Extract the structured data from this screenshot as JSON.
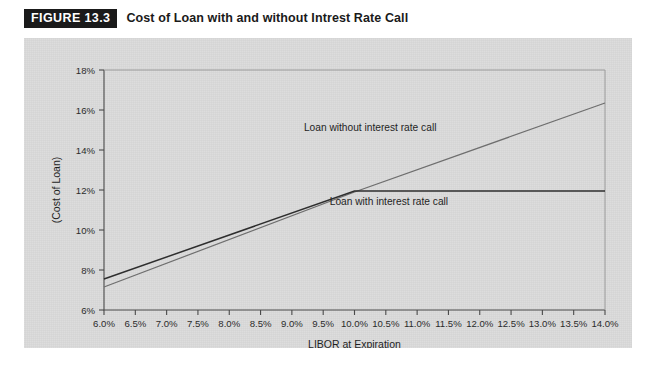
{
  "header": {
    "figure_tag": "FIGURE 13.3",
    "title": "Cost of Loan with and without Intrest Rate Call"
  },
  "chart_data": {
    "type": "line",
    "title": "Cost of Loan with and without Intrest Rate Call",
    "xlabel": "LIBOR at Expiration",
    "ylabel": "(Cost of Loan)",
    "grid": false,
    "legend_position": "inline-annotations",
    "xlim": [
      6.0,
      14.0
    ],
    "ylim": [
      6,
      18
    ],
    "y_ticks": [
      "6%",
      "8%",
      "10%",
      "12%",
      "14%",
      "16%",
      "18%"
    ],
    "y_tick_values": [
      6,
      8,
      10,
      12,
      14,
      16,
      18
    ],
    "x_ticks": [
      "6.0%",
      "6.5%",
      "7.0%",
      "7.5%",
      "8.0%",
      "8.5%",
      "9.0%",
      "9.5%",
      "10.0%",
      "10.5%",
      "11.0%",
      "11.5%",
      "12.0%",
      "12.5%",
      "13.0%",
      "13.5%",
      "14.0%"
    ],
    "x_tick_values": [
      6.0,
      6.5,
      7.0,
      7.5,
      8.0,
      8.5,
      9.0,
      9.5,
      10.0,
      10.5,
      11.0,
      11.5,
      12.0,
      12.5,
      13.0,
      13.5,
      14.0
    ],
    "x": [
      6.0,
      14.0
    ],
    "series": [
      {
        "name": "Loan without interest rate call",
        "annotation": "Loan without interest rate call",
        "color": "#6e6e6e",
        "x": [
          6.0,
          10.0,
          14.0
        ],
        "values": [
          7.15,
          11.9,
          16.35
        ]
      },
      {
        "name": "Loan with interest rate call",
        "annotation": "Loan with interest rate call",
        "color": "#2e2e2e",
        "x": [
          6.0,
          10.0,
          14.0
        ],
        "values": [
          7.55,
          11.95,
          11.95
        ]
      }
    ],
    "cap_point": {
      "x": 10.0,
      "y": 11.95
    }
  },
  "colors": {
    "panel_background": "#d9d9d9",
    "page_background": "#ffffff",
    "axis": "#4a4a4a",
    "tag_background": "#1a1a1a",
    "tag_text": "#ffffff",
    "line_without_call": "#6e6e6e",
    "line_with_call": "#2e2e2e"
  }
}
